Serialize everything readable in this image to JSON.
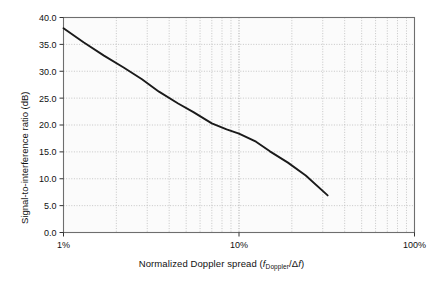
{
  "figure": {
    "background": "#ffffff",
    "plot_background": "#fbfbfb",
    "frame_color": "#6e6e6e",
    "grid_color": "#b9b9b9",
    "line_color": "#1a1a1a"
  },
  "axis_titles": {
    "y": "Signal-to-interference ratio (dB)",
    "x_prefix": "Normalized Doppler spread (",
    "x_f1": "f",
    "x_sub": "Doppler",
    "x_slash": "/Δ",
    "x_f2": "f",
    "x_suffix": ")"
  },
  "chart_data": {
    "type": "line",
    "title": "",
    "subtitle": "",
    "xlabel": "Normalized Doppler spread (f_Doppler/Δf)",
    "ylabel": "Signal-to-interference ratio (dB)",
    "xscale": "log",
    "yscale": "linear",
    "xlim": [
      0.01,
      1.0
    ],
    "ylim": [
      0.0,
      40.0
    ],
    "grid": true,
    "legend": null,
    "x_tick_labels": [
      "1%",
      "10%",
      "100%"
    ],
    "x_tick_values": [
      0.01,
      0.1,
      1.0
    ],
    "x_minor_ticks": [
      0.02,
      0.03,
      0.04,
      0.05,
      0.06,
      0.07,
      0.08,
      0.09,
      0.2,
      0.3,
      0.4,
      0.5,
      0.6,
      0.7,
      0.8,
      0.9
    ],
    "y_tick_labels": [
      "0.0",
      "5.0",
      "10.0",
      "15.0",
      "20.0",
      "25.0",
      "30.0",
      "35.0",
      "40.0"
    ],
    "y_tick_values": [
      0.0,
      5.0,
      10.0,
      15.0,
      20.0,
      25.0,
      30.0,
      35.0,
      40.0
    ],
    "series": [
      {
        "name": "Signal-to-interference ratio",
        "color": "#1a1a1a",
        "x": [
          0.01,
          0.013,
          0.017,
          0.022,
          0.028,
          0.035,
          0.045,
          0.055,
          0.07,
          0.085,
          0.1,
          0.125,
          0.15,
          0.19,
          0.24,
          0.32
        ],
        "y": [
          38.0,
          35.4,
          32.9,
          30.7,
          28.5,
          26.2,
          24.0,
          22.4,
          20.3,
          19.2,
          18.4,
          16.9,
          15.1,
          13.0,
          10.6,
          6.9
        ]
      }
    ]
  }
}
